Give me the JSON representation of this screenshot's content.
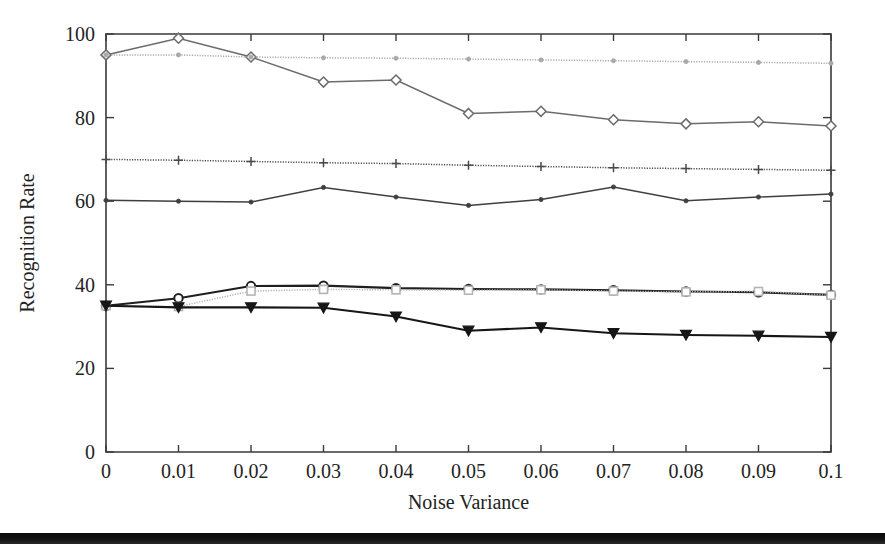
{
  "figure": {
    "background": "#ffffff",
    "bottom_bar_color": "#0d0d0d"
  },
  "axes": {
    "xlabel": "Noise Variance",
    "ylabel": "Recognition Rate",
    "xticklabels": [
      "0",
      "0.01",
      "0.02",
      "0.03",
      "0.04",
      "0.05",
      "0.06",
      "0.07",
      "0.08",
      "0.09",
      "0.1"
    ],
    "yticklabels": [
      "0",
      "20",
      "40",
      "60",
      "80",
      "100"
    ]
  },
  "chart_data": {
    "type": "line",
    "title": "",
    "xlabel": "Noise Variance",
    "ylabel": "Recognition Rate",
    "xlim": [
      0,
      0.1
    ],
    "ylim": [
      0,
      100
    ],
    "xticks": [
      0,
      0.01,
      0.02,
      0.03,
      0.04,
      0.05,
      0.06,
      0.07,
      0.08,
      0.09,
      0.1
    ],
    "yticks": [
      0,
      20,
      40,
      60,
      80,
      100
    ],
    "grid": false,
    "legend": "none",
    "x": [
      0,
      0.01,
      0.02,
      0.03,
      0.04,
      0.05,
      0.06,
      0.07,
      0.08,
      0.09,
      0.1
    ],
    "series": [
      {
        "name": "series-diamond-declining",
        "marker": "diamond",
        "color": "#6b6b6b",
        "linestyle": "solid",
        "values": [
          95,
          99,
          94.5,
          88.5,
          89,
          81,
          81.5,
          79.5,
          78.5,
          79,
          78
        ]
      },
      {
        "name": "series-dotted-upper-flat",
        "marker": "dot",
        "color": "#a8a8a8",
        "linestyle": "dotted",
        "values": [
          95,
          95,
          94.5,
          94.3,
          94.2,
          94,
          93.8,
          93.6,
          93.4,
          93.2,
          93
        ]
      },
      {
        "name": "series-plus-70",
        "marker": "plus",
        "color": "#4a4a4a",
        "linestyle": "dotted",
        "values": [
          70,
          69.8,
          69.5,
          69.2,
          69,
          68.6,
          68.3,
          68,
          67.8,
          67.6,
          67.4
        ]
      },
      {
        "name": "series-dot-60",
        "marker": "smalldot",
        "color": "#3f3f3f",
        "linestyle": "solid",
        "values": [
          60.2,
          60,
          59.8,
          63.3,
          61,
          59,
          60.4,
          63.4,
          60.1,
          61,
          61.7
        ]
      },
      {
        "name": "series-circle-lower",
        "marker": "circle",
        "color": "#1f1f1f",
        "linestyle": "solid",
        "values": [
          35,
          36.8,
          39.7,
          39.8,
          39.2,
          39,
          38.9,
          38.7,
          38.4,
          38.2,
          37.6
        ]
      },
      {
        "name": "series-square-lower",
        "marker": "square",
        "color": "#b4b4b4",
        "linestyle": "dotted",
        "values": [
          35,
          34.8,
          38.5,
          38.9,
          38.8,
          38.7,
          38.8,
          38.5,
          38.3,
          38.4,
          37.5
        ]
      },
      {
        "name": "series-triangle-down-lowest",
        "marker": "triangle-down",
        "color": "#161616",
        "linestyle": "solid",
        "values": [
          35,
          34.6,
          34.6,
          34.5,
          32.4,
          29,
          29.8,
          28.4,
          28,
          27.8,
          27.5
        ]
      }
    ]
  }
}
